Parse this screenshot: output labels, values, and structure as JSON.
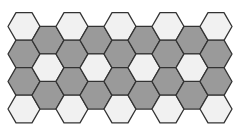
{
  "diagram": {
    "title": "",
    "type": "hexagonal-grid",
    "orientation": "flat-top",
    "colors": {
      "background": "#ffffff",
      "light": "#f1f1f1",
      "dark": "#9a9a9a",
      "stroke": "#333333"
    },
    "geometry": {
      "radius": 16,
      "column_step": 24,
      "row_step": 27.5,
      "first_center_x": 24,
      "even_column_first_y": 26.5,
      "odd_column_first_y": 40.25
    },
    "columns": [
      {
        "index": 0,
        "cells": [
          "light",
          "dark",
          "dark",
          "light"
        ]
      },
      {
        "index": 1,
        "cells": [
          "dark",
          "light",
          "dark"
        ]
      },
      {
        "index": 2,
        "cells": [
          "light",
          "dark",
          "dark",
          "light"
        ]
      },
      {
        "index": 3,
        "cells": [
          "dark",
          "light",
          "dark"
        ]
      },
      {
        "index": 4,
        "cells": [
          "light",
          "dark",
          "dark",
          "light"
        ]
      },
      {
        "index": 5,
        "cells": [
          "dark",
          "light",
          "dark"
        ]
      },
      {
        "index": 6,
        "cells": [
          "light",
          "dark",
          "dark",
          "light"
        ]
      },
      {
        "index": 7,
        "cells": [
          "dark",
          "light",
          "dark"
        ]
      },
      {
        "index": 8,
        "cells": [
          "light",
          "dark",
          "dark",
          "light"
        ]
      }
    ],
    "counts": {
      "total_cells": 32,
      "light_cells": 13,
      "dark_cells": 19
    }
  }
}
